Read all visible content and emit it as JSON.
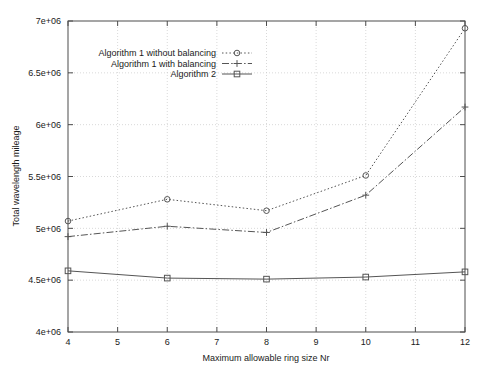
{
  "chart_data": {
    "type": "line",
    "title": "",
    "xlabel": "Maximum allowable ring size Nr",
    "ylabel": "Total wavelength mileage",
    "x": [
      4,
      6,
      8,
      10,
      12
    ],
    "xlim": [
      4,
      12
    ],
    "ylim": [
      4000000,
      7000000
    ],
    "xticks": [
      "4",
      "5",
      "6",
      "7",
      "8",
      "9",
      "10",
      "11",
      "12"
    ],
    "xtick_values": [
      4,
      5,
      6,
      7,
      8,
      9,
      10,
      11,
      12
    ],
    "yticks": [
      "4e+06",
      "4.5e+06",
      "5e+06",
      "5.5e+06",
      "6e+06",
      "6.5e+06",
      "7e+06"
    ],
    "ytick_values": [
      4000000,
      4500000,
      5000000,
      5500000,
      6000000,
      6500000,
      7000000
    ],
    "grid": true,
    "legend_position": "top-left-inside",
    "series": [
      {
        "name": "Algorithm 1 without balancing",
        "marker": "circle",
        "linestyle": "dotted",
        "color": "#555555",
        "values": [
          5070000,
          5280000,
          5170000,
          5510000,
          6930000
        ]
      },
      {
        "name": "Algorithm 1 with balancing",
        "marker": "plus",
        "linestyle": "dashdot",
        "color": "#555555",
        "values": [
          4920000,
          5020000,
          4960000,
          5320000,
          6170000
        ]
      },
      {
        "name": "Algorithm 2",
        "marker": "square",
        "linestyle": "solid",
        "color": "#555555",
        "values": [
          4590000,
          4520000,
          4510000,
          4530000,
          4580000
        ]
      }
    ]
  },
  "legend": {
    "items": [
      {
        "label": "Algorithm 1 without balancing"
      },
      {
        "label": "Algorithm 1 with balancing"
      },
      {
        "label": "Algorithm 2"
      }
    ]
  },
  "axes": {
    "x_title": "Maximum allowable ring size Nr",
    "y_title": "Total wavelength mileage"
  }
}
